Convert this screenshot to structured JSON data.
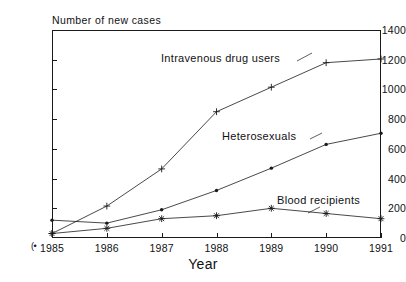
{
  "chart_data": {
    "type": "line",
    "title": "",
    "subtitle": "",
    "xlabel": "Year",
    "ylabel": "Number of new cases",
    "categories": [
      "1985",
      "1986",
      "1987",
      "1988",
      "1989",
      "1990",
      "1991"
    ],
    "x": [
      1985,
      1986,
      1987,
      1988,
      1989,
      1990,
      1991
    ],
    "xlim": [
      1985,
      1991
    ],
    "ylim": [
      0,
      1400
    ],
    "yticks": [
      0,
      200,
      400,
      600,
      800,
      1000,
      1200,
      1400
    ],
    "ytick_labels": [
      "0",
      "200",
      "400",
      "600",
      "800",
      "1000",
      "1200",
      "1400"
    ],
    "grid": false,
    "legend_position": "in-plot-annotations",
    "series": [
      {
        "name": "Intravenous drug users",
        "marker": "plus",
        "color": "#1a1a1a",
        "values": [
          30,
          215,
          465,
          850,
          1015,
          1180,
          1205
        ]
      },
      {
        "name": "Heterosexuals",
        "marker": "dot",
        "color": "#1a1a1a",
        "values": [
          120,
          100,
          190,
          320,
          470,
          630,
          705
        ]
      },
      {
        "name": "Blood recipients",
        "marker": "asterisk",
        "color": "#1a1a1a",
        "values": [
          30,
          65,
          130,
          150,
          200,
          165,
          130
        ]
      }
    ],
    "annotations": [
      {
        "text": "Intravenous drug users",
        "series": "Intravenous drug users"
      },
      {
        "text": "Heterosexuals",
        "series": "Heterosexuals"
      },
      {
        "text": "Blood recipients",
        "series": "Blood recipients"
      }
    ]
  },
  "figure": {
    "origin_glyph": "(•",
    "background_color": "#ffffff",
    "axis_color": "#1a1a1a"
  }
}
